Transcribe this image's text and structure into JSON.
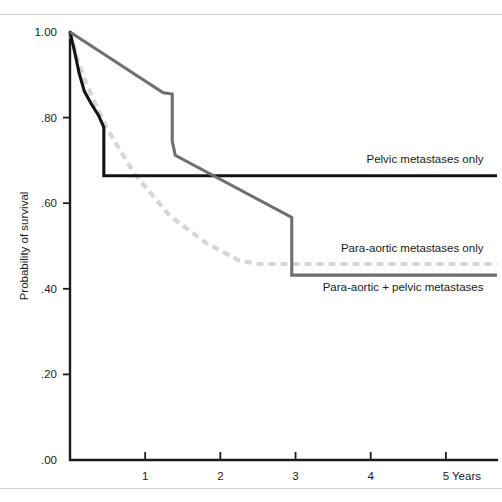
{
  "chart_data": {
    "type": "line",
    "title": "",
    "xlabel": "Years",
    "ylabel": "Probability of survival",
    "xlim": [
      0,
      5.68
    ],
    "ylim": [
      0.0,
      1.0
    ],
    "grid": false,
    "legend_position": "inline-right",
    "x_ticks": [
      "1",
      "2",
      "3",
      "4",
      "5"
    ],
    "x_tick_values": [
      1,
      2,
      3,
      4,
      5
    ],
    "y_ticks": [
      "1.00",
      ".80",
      ".60",
      ".40",
      ".20",
      ".00"
    ],
    "y_tick_values": [
      1.0,
      0.8,
      0.6,
      0.4,
      0.2,
      0.0
    ],
    "series": [
      {
        "name": "Pelvic metastases only",
        "style": "solid",
        "color": "#141414",
        "label_x": 5.5,
        "label_y": 0.695,
        "points": [
          [
            0.0,
            1.0
          ],
          [
            0.06,
            0.955
          ],
          [
            0.12,
            0.905
          ],
          [
            0.19,
            0.862
          ],
          [
            0.28,
            0.833
          ],
          [
            0.38,
            0.805
          ],
          [
            0.45,
            0.777
          ],
          [
            0.45,
            0.664
          ],
          [
            5.68,
            0.664
          ]
        ]
      },
      {
        "name": "Para-aortic + pelvic metastases",
        "style": "solid",
        "color": "#6f6f6f",
        "label_x": 5.5,
        "label_y": 0.395,
        "points": [
          [
            0.0,
            1.0
          ],
          [
            1.24,
            0.858
          ],
          [
            1.36,
            0.855
          ],
          [
            1.36,
            0.745
          ],
          [
            1.4,
            0.712
          ],
          [
            2.95,
            0.567
          ],
          [
            2.95,
            0.432
          ],
          [
            5.68,
            0.432
          ]
        ]
      },
      {
        "name": "Para-aortic metastases only",
        "style": "dashed",
        "color": "#d6d6d6",
        "label_x": 5.5,
        "label_y": 0.487,
        "points": [
          [
            0.0,
            1.0
          ],
          [
            0.1,
            0.935
          ],
          [
            0.22,
            0.878
          ],
          [
            0.36,
            0.823
          ],
          [
            0.5,
            0.772
          ],
          [
            0.86,
            0.668
          ],
          [
            1.33,
            0.57
          ],
          [
            1.82,
            0.506
          ],
          [
            2.25,
            0.466
          ],
          [
            2.52,
            0.458
          ],
          [
            5.68,
            0.458
          ]
        ]
      }
    ]
  }
}
